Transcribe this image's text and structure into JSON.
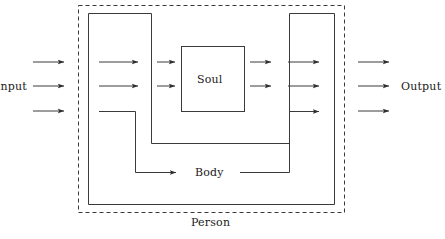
{
  "diagram": {
    "type": "block-flow-diagram",
    "labels": {
      "input": "Input",
      "output": "Output",
      "soul": "Soul",
      "body": "Body",
      "person": "Person"
    },
    "boxes": [
      {
        "name": "person",
        "label": "Person",
        "stroke_style": "dashed",
        "shape": "rectangle",
        "x": 78,
        "y": 5,
        "width": 267,
        "height": 208
      },
      {
        "name": "body",
        "label": "Body",
        "stroke_style": "solid",
        "shape": "u-shaped-channel",
        "outer_left": 88,
        "outer_right": 335,
        "outer_top": 13,
        "outer_bottom": 205,
        "inner_left": 151,
        "inner_right": 290,
        "inner_bottom": 143
      },
      {
        "name": "soul",
        "label": "Soul",
        "stroke_style": "solid",
        "shape": "rectangle",
        "x": 181,
        "y": 46,
        "width": 64,
        "height": 66
      }
    ],
    "arrow_groups": [
      {
        "name": "input-arrows",
        "count": 3,
        "x1": 33,
        "x2": 65,
        "ys": [
          62,
          86,
          111
        ]
      },
      {
        "name": "body-in-arrows",
        "count": 2,
        "x1": 99,
        "x2": 139,
        "ys": [
          62,
          86
        ]
      },
      {
        "name": "soul-in-arrows",
        "count": 2,
        "x1": 157,
        "x2": 176,
        "ys": [
          62,
          86
        ]
      },
      {
        "name": "soul-out-arrows",
        "count": 2,
        "x1": 250,
        "x2": 272,
        "ys": [
          62,
          86
        ]
      },
      {
        "name": "body-out-arrows",
        "count": 2,
        "x1": 288,
        "x2": 320,
        "ys": [
          62,
          86
        ]
      },
      {
        "name": "output-arrows",
        "count": 3,
        "x1": 358,
        "x2": 390,
        "ys": [
          62,
          86,
          111
        ]
      }
    ],
    "bypass_path": {
      "name": "body-bypass",
      "description": "Third input bypasses the soul, routing down through the body and back up to the third output",
      "in_segment": {
        "x1": 99,
        "y1": 111,
        "x2": 135,
        "y2": 111,
        "then_down_to": 172,
        "then_right_to": 178,
        "arrow": true
      },
      "out_segment": {
        "x1": 240,
        "y1": 172,
        "x2": 290,
        "y2": 172,
        "then_up_to": 111,
        "then_right_to": 320,
        "arrow": true
      }
    },
    "colors": {
      "stroke": "#3a3a3a",
      "text": "#1a1a1a",
      "background": "#ffffff"
    }
  }
}
